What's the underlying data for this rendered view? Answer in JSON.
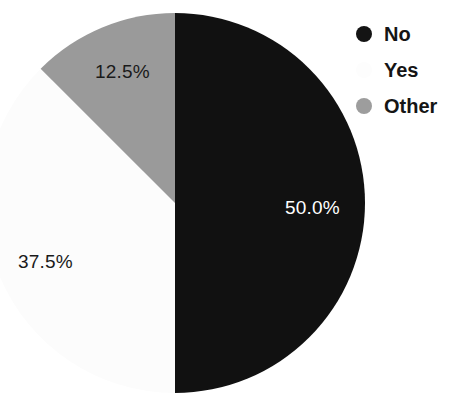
{
  "chart_data": {
    "type": "pie",
    "title": "",
    "categories": [
      "No",
      "Yes",
      "Other"
    ],
    "values": [
      50.0,
      37.5,
      12.5
    ],
    "unit": "%",
    "data_labels": [
      "50.0%",
      "37.5%",
      "12.5%"
    ],
    "colors": [
      "#111111",
      "#fcfcfc",
      "#9a9a9a"
    ],
    "start_angle_deg": 0,
    "direction": "clockwise",
    "legend": {
      "position": "top-right",
      "entries": [
        {
          "label": "No",
          "marker": "circle-filled",
          "color": "#141414"
        },
        {
          "label": "Yes",
          "marker": "circle-filled",
          "color": "#fdfdfd"
        },
        {
          "label": "Other",
          "marker": "circle-filled",
          "color": "#9d9d9d"
        }
      ]
    },
    "slices": [
      {
        "name": "No",
        "value": 50.0,
        "label": "50.0%",
        "color": "#111111",
        "label_color": "#ffffff"
      },
      {
        "name": "Yes",
        "value": 37.5,
        "label": "37.5%",
        "color": "#fcfcfc",
        "label_color": "#1a1a1a"
      },
      {
        "name": "Other",
        "value": 12.5,
        "label": "12.5%",
        "color": "#9a9a9a",
        "label_color": "#1a1a1a"
      }
    ]
  }
}
